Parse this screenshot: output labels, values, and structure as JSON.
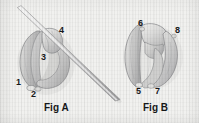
{
  "figure": {
    "background_color": "#f1f1ef",
    "ink_color": "#17181a",
    "panels": [
      {
        "id": "panel-a",
        "caption": "Fig A",
        "description": "Shaded bi-lobed leaflet structure with a long straight needle passing diagonally from upper-left to lower-right",
        "callouts": [
          {
            "label": "1",
            "x": 17,
            "y": 79
          },
          {
            "label": "2",
            "x": 32,
            "y": 90
          },
          {
            "label": "3",
            "x": 42,
            "y": 54
          },
          {
            "label": "4",
            "x": 60,
            "y": 28
          }
        ],
        "instrument": {
          "name": "needle",
          "from_x": 17,
          "from_y": 7,
          "to_x": 120,
          "to_y": 100
        }
      },
      {
        "id": "panel-b",
        "caption": "Fig B",
        "description": "Shaded bi-lobed leaflet structure shown closed, without instrument",
        "callouts": [
          {
            "label": "6",
            "x": 139,
            "y": 22
          },
          {
            "label": "8",
            "x": 176,
            "y": 29
          },
          {
            "label": "5",
            "x": 137,
            "y": 87
          },
          {
            "label": "7",
            "x": 156,
            "y": 87
          }
        ]
      }
    ],
    "captions": {
      "fig_a": {
        "text": "Fig A",
        "x": 44,
        "y": 104
      },
      "fig_b": {
        "text": "Fig B",
        "x": 143,
        "y": 104
      }
    }
  }
}
